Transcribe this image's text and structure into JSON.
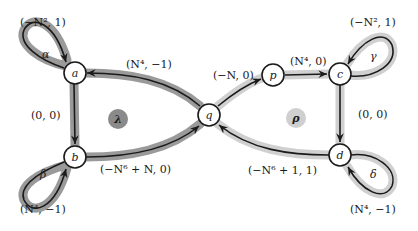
{
  "diagram": {
    "colors": {
      "left_halo": "#9a9a9a",
      "right_halo": "#cfcfcf",
      "edge": "#1a1a1a",
      "node_fill": "#ffffff",
      "lambda_fill": "#8a8a8a",
      "rho_fill": "#cfcfcf"
    },
    "nodes": [
      {
        "id": "a",
        "label": "a"
      },
      {
        "id": "b",
        "label": "b"
      },
      {
        "id": "q",
        "label": "q"
      },
      {
        "id": "p",
        "label": "p"
      },
      {
        "id": "c",
        "label": "c"
      },
      {
        "id": "d",
        "label": "d"
      }
    ],
    "regions": {
      "lambda": "λ",
      "rho": "ρ"
    },
    "loops": {
      "alpha": {
        "name": "α",
        "weight": "(−N², 1)"
      },
      "beta": {
        "name": "β",
        "weight": "(N⁴, −1)"
      },
      "gamma": {
        "name": "γ",
        "weight": "(−N², 1)"
      },
      "delta": {
        "name": "δ",
        "weight": "(N⁴, −1)"
      }
    },
    "edges": {
      "q_to_a": "(N⁴, −1)",
      "a_to_b": "(0, 0)",
      "b_to_q": "(−N⁶ + N, 0)",
      "q_to_p": "(−N, 0)",
      "p_to_c": "(N⁴, 0)",
      "c_to_d": "(0, 0)",
      "d_to_q": "(−N⁶ + 1, 1)"
    }
  }
}
